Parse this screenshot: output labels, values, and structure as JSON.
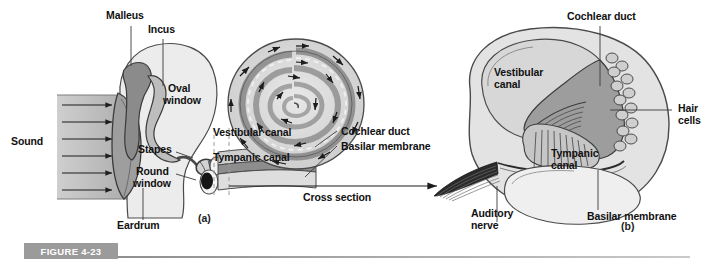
{
  "figure": {
    "badge_label": "FIGURE 4-23",
    "panel_a_letter": "(a)",
    "panel_b_letter": "(b)"
  },
  "panel_a": {
    "name": "ear-cross-section-diagram",
    "labels": {
      "malleus": "Malleus",
      "incus": "Incus",
      "oval_window_line1": "Oval",
      "oval_window_line2": "window",
      "stapes": "Stapes",
      "round_window_line1": "Round",
      "round_window_line2": "window",
      "eardrum": "Eardrum",
      "sound": "Sound",
      "vestibular_canal": "Vestibular canal",
      "tympanic_canal": "Tympanic canal",
      "cochlear_duct": "Cochlear duct",
      "basilar_membrane": "Basilar membrane",
      "cross_section": "Cross section"
    }
  },
  "panel_b": {
    "name": "cochlea-cross-section-detail",
    "labels": {
      "cochlear_duct": "Cochlear duct",
      "vestibular_canal_line1": "Vestibular",
      "vestibular_canal_line2": "canal",
      "hair_cells_line1": "Hair",
      "hair_cells_line2": "cells",
      "tympanic_canal_line1": "Tympanic",
      "tympanic_canal_line2": "canal",
      "auditory_nerve_line1": "Auditory",
      "auditory_nerve_line2": "nerve",
      "basilar_membrane": "Basilar membrane"
    }
  },
  "colors": {
    "badge_gray": "#9b9b9b",
    "ink": "#111111",
    "tissue_light": "#e4e4e4",
    "tissue_mid": "#c2c2c2",
    "tissue_dark": "#8e8e8e",
    "tissue_darker": "#6f6f6f",
    "stroke": "#3a3a3a"
  }
}
